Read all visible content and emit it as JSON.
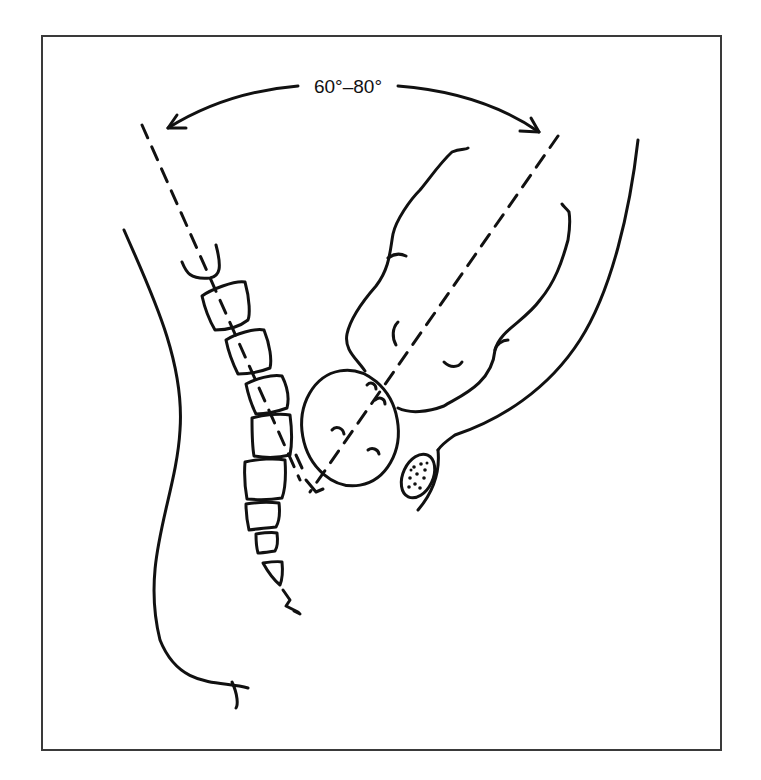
{
  "figure": {
    "angle_label": "60°–80°",
    "line_color": "#111111",
    "frame_color": "#3a3a3a",
    "background": "#ffffff"
  },
  "parts": {
    "spine_vertebrae_count": 9,
    "labels": [
      "spine-axis",
      "uterine-axis",
      "vertebral-column",
      "uterus",
      "bladder",
      "pubic-bone",
      "anterior-abdominal-wall",
      "posterior-body-contour"
    ]
  }
}
